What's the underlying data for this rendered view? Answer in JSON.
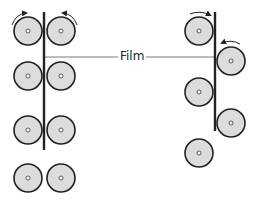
{
  "diagram": {
    "label": "Film",
    "colors": {
      "roller_fill": "#dcdcdc",
      "roller_stroke": "#222222",
      "film": "#222222",
      "leader": "#555555",
      "background": "#ffffff"
    },
    "left_configuration": {
      "description": "Film passes vertically between paired rollers",
      "film_x": 44,
      "film_y1": 12,
      "film_y2": 150,
      "rollers": [
        {
          "cx": 28,
          "cy": 31,
          "rotation_arrow": "clockwise"
        },
        {
          "cx": 61,
          "cy": 31,
          "rotation_arrow": "counterclockwise"
        },
        {
          "cx": 28,
          "cy": 76
        },
        {
          "cx": 61,
          "cy": 76
        },
        {
          "cx": 28,
          "cy": 130
        },
        {
          "cx": 61,
          "cy": 130
        },
        {
          "cx": 28,
          "cy": 178
        },
        {
          "cx": 61,
          "cy": 178
        }
      ]
    },
    "right_configuration": {
      "description": "Film passes between staggered offset rollers",
      "film_x": 215,
      "film_y1": 12,
      "film_y2": 131,
      "rollers": [
        {
          "cx": 199,
          "cy": 31,
          "rotation_arrow": "clockwise"
        },
        {
          "cx": 231,
          "cy": 61,
          "rotation_arrow": "counterclockwise"
        },
        {
          "cx": 199,
          "cy": 92
        },
        {
          "cx": 231,
          "cy": 123
        },
        {
          "cx": 199,
          "cy": 153
        }
      ]
    },
    "roller_radius": 14
  }
}
